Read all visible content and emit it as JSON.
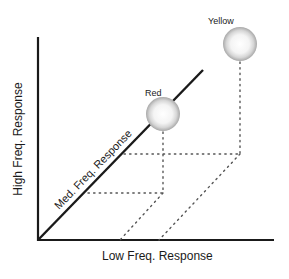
{
  "diagram": {
    "type": "3d-frequency-response-axes",
    "axes": {
      "x_label": "Low Freq. Response",
      "y_label": "High Freq. Response",
      "z_label": "Med. Freq. Response"
    },
    "points": [
      {
        "name": "Red",
        "label": "Red"
      },
      {
        "name": "Yellow",
        "label": "Yellow"
      }
    ],
    "colors": {
      "axis": "#1a1a1a",
      "dotted": "#555555",
      "sphere_highlight": "#ffffff",
      "sphere_shadow": "#9a9a9a"
    }
  }
}
